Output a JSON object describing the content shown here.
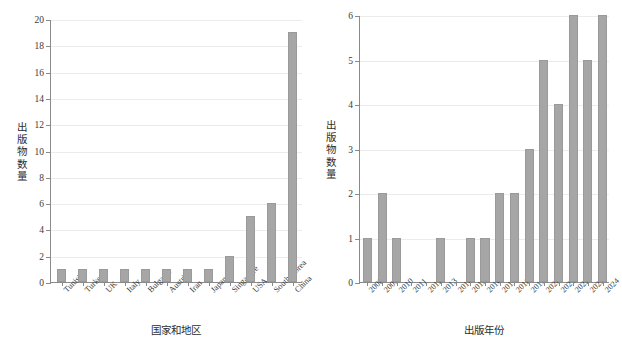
{
  "figure": {
    "width": 622,
    "height": 346,
    "background": "#ffffff",
    "bar_color": "#a6a6a6",
    "bar_edge_color": "#9a9a9a",
    "axis_color": "#8a8a8a",
    "grid_color": "#ececec"
  },
  "chart_data": [
    {
      "type": "bar",
      "title": "",
      "xlabel": "国家和地区",
      "ylabel": "出版物数量",
      "ylabel_chars": [
        "出",
        "版",
        "物",
        "数",
        "量"
      ],
      "categories": [
        "Tunisia",
        "Turkey",
        "UK",
        "Italy",
        "Bulgaria",
        "Austria",
        "Iran",
        "Japan",
        "Singapore",
        "USA",
        "South Korea",
        "China"
      ],
      "values": [
        1,
        1,
        1,
        1,
        1,
        1,
        1,
        1,
        2,
        5,
        6,
        19
      ],
      "ylim": [
        0,
        20
      ],
      "yticks": [
        0,
        2,
        4,
        6,
        8,
        10,
        12,
        14,
        16,
        18,
        20
      ],
      "grid": true,
      "legend": "none",
      "xtick_rotation": -45
    },
    {
      "type": "bar",
      "title": "",
      "xlabel": "出版年份",
      "ylabel": "出版物数量",
      "ylabel_chars": [
        "出",
        "版",
        "物",
        "数",
        "量"
      ],
      "categories": [
        "2008",
        "2009",
        "2010",
        "2011",
        "2012",
        "2013",
        "2014",
        "2015",
        "2016",
        "2017",
        "2018",
        "2019",
        "2020",
        "2021",
        "2022",
        "2023",
        "2024"
      ],
      "values": [
        1,
        2,
        1,
        0,
        0,
        1,
        0,
        1,
        1,
        2,
        2,
        3,
        5,
        4,
        6,
        5,
        6
      ],
      "ylim": [
        0,
        6
      ],
      "yticks": [
        0,
        1,
        2,
        3,
        4,
        5,
        6
      ],
      "grid": true,
      "legend": "none",
      "xtick_rotation": -45
    }
  ]
}
